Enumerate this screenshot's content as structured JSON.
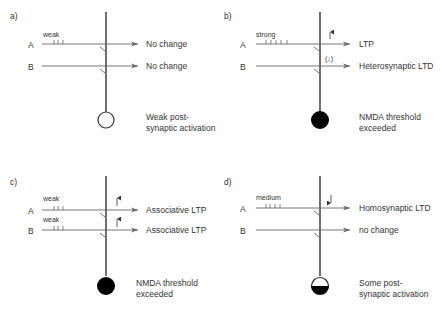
{
  "panels": [
    {
      "id": "a",
      "label": "a)",
      "pathways": [
        {
          "name": "A",
          "stimulus": "weak",
          "ticks": 3,
          "outcome": "No change",
          "arrow": ""
        },
        {
          "name": "B",
          "stimulus": "",
          "ticks": 0,
          "outcome": "No change",
          "arrow": ""
        }
      ],
      "soma": "empty",
      "soma_text": [
        "Weak post-",
        "synaptic activation"
      ]
    },
    {
      "id": "b",
      "label": "b)",
      "pathways": [
        {
          "name": "A",
          "stimulus": "strong",
          "ticks": 5,
          "outcome": "LTP",
          "arrow": "↑"
        },
        {
          "name": "B",
          "stimulus": "",
          "ticks": 0,
          "outcome": "Heterosynaptic LTD",
          "arrow": "(↓)"
        }
      ],
      "soma": "filled",
      "soma_text": [
        "NMDA threshold",
        "exceeded"
      ]
    },
    {
      "id": "c",
      "label": "c)",
      "pathways": [
        {
          "name": "A",
          "stimulus": "weak",
          "ticks": 3,
          "outcome": "Associative LTP",
          "arrow": "↑"
        },
        {
          "name": "B",
          "stimulus": "weak",
          "ticks": 3,
          "outcome": "Associative LTP",
          "arrow": "↑"
        }
      ],
      "soma": "filled",
      "soma_text": [
        "NMDA threshold",
        "exceeded"
      ]
    },
    {
      "id": "d",
      "label": "d)",
      "pathways": [
        {
          "name": "A",
          "stimulus": "medium",
          "ticks": 4,
          "outcome": "Homosynaptic LTD",
          "arrow": "↓"
        },
        {
          "name": "B",
          "stimulus": "",
          "ticks": 0,
          "outcome": "no change",
          "arrow": ""
        }
      ],
      "soma": "half",
      "soma_text": [
        "Some post-",
        "synaptic activation"
      ]
    }
  ]
}
